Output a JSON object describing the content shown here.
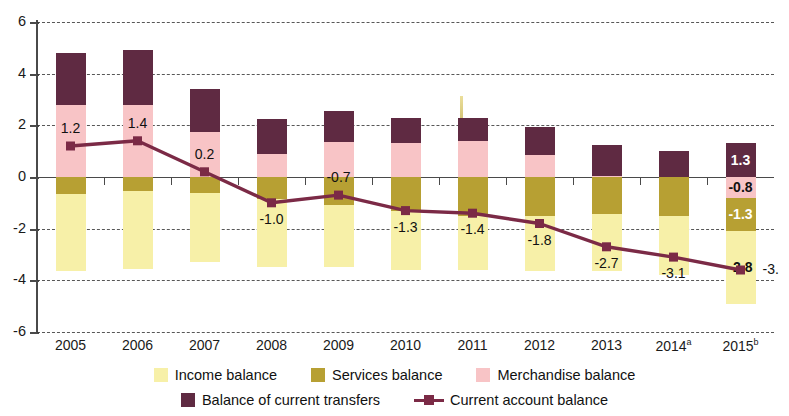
{
  "chart_data": {
    "type": "bar",
    "title": "",
    "subtitle": "",
    "xlabel": "",
    "ylabel": "",
    "ylim": [
      -6,
      6
    ],
    "grid": true,
    "legend_position": "bottom",
    "stacked": true,
    "categories": [
      "2005",
      "2006",
      "2007",
      "2008",
      "2009",
      "2010",
      "2011",
      "2012",
      "2013",
      "2014",
      "2015"
    ],
    "category_labels": [
      "2005",
      "2006",
      "2007",
      "2008",
      "2009",
      "2010",
      "2011",
      "2012",
      "2013",
      "2014",
      "2015"
    ],
    "category_superscripts": [
      "",
      "",
      "",
      "",
      "",
      "",
      "",
      "",
      "",
      "a",
      "b"
    ],
    "y_ticks": [
      6,
      4,
      2,
      0,
      -2,
      -4,
      -6
    ],
    "y_tick_labels": [
      "6",
      "4",
      "2",
      "0",
      "-2",
      "-4",
      "-6"
    ],
    "series": [
      {
        "name": "Income balance",
        "color": "#f7f0a8",
        "type": "bar",
        "values": [
          -3.0,
          -3.0,
          -2.7,
          -2.65,
          -2.4,
          -2.3,
          -2.1,
          -2.15,
          -2.2,
          -2.3,
          -2.8
        ],
        "labels": [
          "",
          "",
          "",
          "",
          "",
          "",
          "",
          "",
          "",
          "",
          "-2.8"
        ]
      },
      {
        "name": "Services balance",
        "color": "#b7a033",
        "type": "bar",
        "values": [
          -0.65,
          -0.55,
          -0.6,
          -0.85,
          -1.1,
          -1.3,
          -1.5,
          -1.5,
          -1.45,
          -1.5,
          -1.3
        ],
        "labels": [
          "",
          "",
          "",
          "",
          "",
          "",
          "",
          "",
          "",
          "",
          "-1.3"
        ]
      },
      {
        "name": "Merchandise balance",
        "color": "#f8c4c6",
        "type": "bar",
        "values": [
          2.8,
          2.8,
          1.75,
          0.9,
          1.35,
          1.3,
          1.4,
          0.85,
          0.05,
          0.0,
          -0.8
        ],
        "labels": [
          "",
          "",
          "",
          "",
          "",
          "",
          "",
          "",
          "",
          "",
          "-0.8"
        ]
      },
      {
        "name": "Balance of current transfers",
        "color": "#5f2a42",
        "type": "bar",
        "values": [
          2.0,
          2.1,
          1.65,
          1.35,
          1.2,
          1.0,
          0.9,
          1.1,
          1.2,
          1.0,
          1.3
        ],
        "labels": [
          "",
          "",
          "",
          "",
          "",
          "",
          "",
          "",
          "",
          "",
          "1.3"
        ]
      },
      {
        "name": "Current account balance",
        "color": "#7b2a46",
        "type": "line",
        "marker": "square",
        "values": [
          1.2,
          1.4,
          0.2,
          -1.0,
          -0.7,
          -1.3,
          -1.4,
          -1.8,
          -2.7,
          -3.1,
          -3.6
        ],
        "labels": [
          "1.2",
          "1.4",
          "0.2",
          "-1.0",
          "-0.7",
          "-1.3",
          "-1.4",
          "-1.8",
          "-2.7",
          "-3.1",
          "-3."
        ],
        "label_positions": [
          "above",
          "above",
          "above",
          "below",
          "above",
          "below",
          "below",
          "below",
          "below",
          "below",
          "right"
        ]
      }
    ]
  },
  "legend": {
    "row1": [
      {
        "label": "Income balance",
        "swatch": "income-swatch"
      },
      {
        "label": "Services balance",
        "swatch": "services-swatch"
      },
      {
        "label": "Merchandise balance",
        "swatch": "merchandise-swatch"
      }
    ],
    "row2": [
      {
        "label": "Balance of current transfers",
        "swatch": "transfers-swatch"
      },
      {
        "label": "Current account balance",
        "swatch": "line-marker-swatch"
      }
    ]
  },
  "colors": {
    "income": "#f7f0a8",
    "services": "#b7a033",
    "merchandise": "#f8c4c6",
    "transfers": "#5f2a42",
    "line": "#7b2a46",
    "axis": "#4a4a4a",
    "grid": "#3a3a3a"
  }
}
